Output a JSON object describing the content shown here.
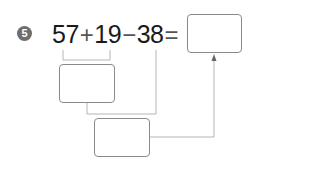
{
  "problem": {
    "number": "5",
    "terms": [
      "57",
      "19",
      "38"
    ],
    "operators": [
      "+",
      "−",
      "="
    ],
    "answer_box": "",
    "intermediate_box_1": "",
    "intermediate_box_2": ""
  },
  "colors": {
    "badge": "#6e6e6e",
    "text": "#1a1a1a",
    "lines": "#b5b5b5",
    "box_border": "#8a8a8a"
  }
}
